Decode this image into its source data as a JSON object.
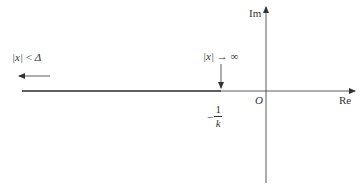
{
  "diagram": {
    "type": "nyquist-plane",
    "axes": {
      "imag_label": "Im",
      "real_label": "Re",
      "origin_label": "O"
    },
    "annotations": {
      "left_condition": {
        "lhs": "|x|",
        "op": "<",
        "rhs": "Δ"
      },
      "point_condition": {
        "lhs": "|x|",
        "op": "→",
        "rhs": "∞"
      },
      "critical_point": {
        "sign": "−",
        "numerator": "1",
        "denominator": "k"
      }
    },
    "colors": {
      "line": "#333333",
      "thick_line": "#444444"
    }
  }
}
